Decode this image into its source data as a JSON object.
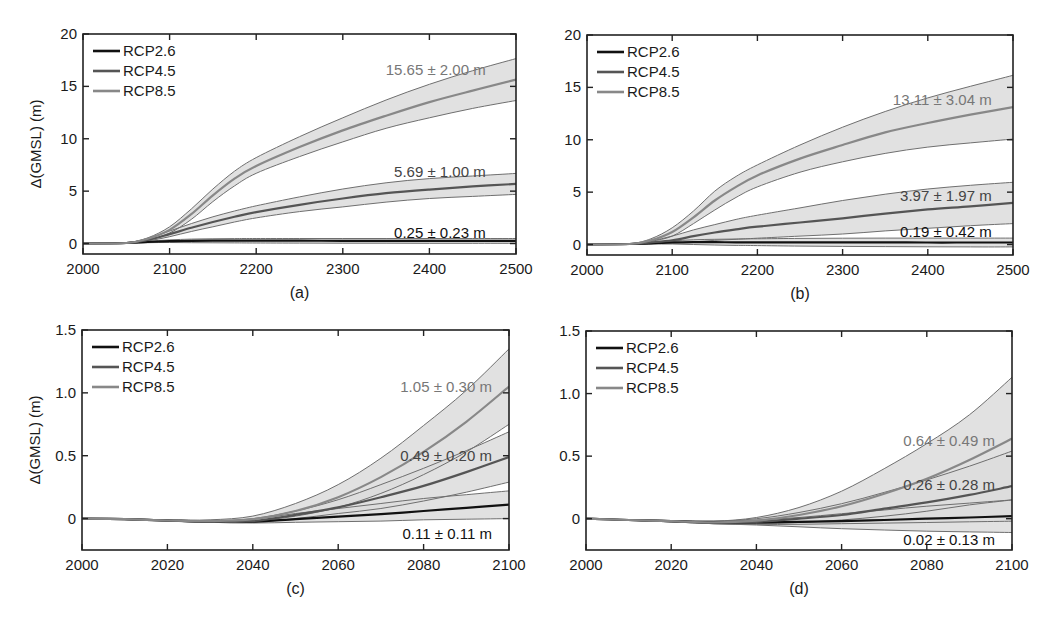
{
  "figure": {
    "ylabel": "Δ(GMSL) (m)",
    "legend": [
      {
        "label": "RCP2.6",
        "color": "#111111"
      },
      {
        "label": "RCP4.5",
        "color": "#555555"
      },
      {
        "label": "RCP8.5",
        "color": "#888888"
      }
    ],
    "band_fill": "#dcdcdc",
    "band_edge": "#6f6f6f"
  },
  "chart_data": [
    {
      "panel": "(a)",
      "type": "area",
      "caption": "(a)",
      "xlim": [
        2000,
        2500
      ],
      "ylim": [
        -1,
        20
      ],
      "xticks": [
        2000,
        2100,
        2200,
        2300,
        2400,
        2500
      ],
      "yticks": [
        0,
        5,
        10,
        15,
        20
      ],
      "ylabel": "Δ(GMSL) (m)",
      "box": {
        "left": 83,
        "right": 516,
        "top": 34,
        "bottom": 254
      },
      "x": [
        2000,
        2050,
        2075,
        2100,
        2125,
        2150,
        2175,
        2200,
        2250,
        2300,
        2350,
        2400,
        2450,
        2500
      ],
      "series": [
        {
          "name": "RCP2.6",
          "color": "#111111",
          "mean": [
            0,
            0.05,
            0.15,
            0.22,
            0.25,
            0.27,
            0.27,
            0.27,
            0.27,
            0.26,
            0.26,
            0.25,
            0.25,
            0.25
          ],
          "upper": [
            0,
            0.08,
            0.22,
            0.35,
            0.42,
            0.45,
            0.47,
            0.48,
            0.48,
            0.48,
            0.48,
            0.48,
            0.48,
            0.48
          ],
          "lower": [
            0,
            0.02,
            0.08,
            0.1,
            0.08,
            0.07,
            0.06,
            0.05,
            0.04,
            0.03,
            0.03,
            0.02,
            0.02,
            0.02
          ]
        },
        {
          "name": "RCP4.5",
          "color": "#555555",
          "mean": [
            0,
            0.05,
            0.35,
            0.9,
            1.5,
            2.05,
            2.55,
            3.0,
            3.7,
            4.3,
            4.8,
            5.15,
            5.45,
            5.69
          ],
          "upper": [
            0,
            0.08,
            0.5,
            1.2,
            1.9,
            2.55,
            3.1,
            3.6,
            4.45,
            5.2,
            5.8,
            6.2,
            6.45,
            6.69
          ],
          "lower": [
            0,
            0.03,
            0.25,
            0.65,
            1.15,
            1.6,
            2.05,
            2.45,
            3.05,
            3.5,
            3.95,
            4.3,
            4.5,
            4.69
          ]
        },
        {
          "name": "RCP8.5",
          "color": "#888888",
          "mean": [
            0,
            0.05,
            0.45,
            1.3,
            2.8,
            4.6,
            6.2,
            7.4,
            9.2,
            10.8,
            12.2,
            13.5,
            14.6,
            15.65
          ],
          "upper": [
            0,
            0.08,
            0.55,
            1.6,
            3.3,
            5.2,
            6.9,
            8.2,
            10.2,
            12.0,
            13.7,
            15.2,
            16.5,
            17.65
          ],
          "lower": [
            0,
            0.03,
            0.35,
            1.0,
            2.3,
            4.0,
            5.5,
            6.7,
            8.3,
            9.7,
            11.0,
            12.0,
            12.9,
            13.65
          ]
        }
      ],
      "annotations": [
        {
          "text": "15.65 ± 2.00 m",
          "x": 2465,
          "y": 16.6,
          "color": "#777777"
        },
        {
          "text": "5.69 ± 1.00 m",
          "x": 2465,
          "y": 6.8,
          "color": "#444444"
        },
        {
          "text": "0.25 ± 0.23 m",
          "x": 2465,
          "y": 1.0,
          "color": "#111111"
        }
      ]
    },
    {
      "panel": "(b)",
      "type": "area",
      "caption": "(b)",
      "xlim": [
        2000,
        2500
      ],
      "ylim": [
        -1,
        20
      ],
      "xticks": [
        2000,
        2100,
        2200,
        2300,
        2400,
        2500
      ],
      "yticks": [
        0,
        5,
        10,
        15,
        20
      ],
      "ylabel": "",
      "box": {
        "left": 587,
        "right": 1013,
        "top": 35,
        "bottom": 255
      },
      "x": [
        2000,
        2050,
        2075,
        2100,
        2125,
        2150,
        2175,
        2200,
        2250,
        2300,
        2350,
        2400,
        2450,
        2500
      ],
      "series": [
        {
          "name": "RCP2.6",
          "color": "#111111",
          "mean": [
            0,
            0.05,
            0.12,
            0.2,
            0.22,
            0.22,
            0.21,
            0.21,
            0.2,
            0.2,
            0.2,
            0.19,
            0.19,
            0.19
          ],
          "upper": [
            0,
            0.08,
            0.2,
            0.35,
            0.45,
            0.5,
            0.53,
            0.55,
            0.58,
            0.6,
            0.61,
            0.61,
            0.61,
            0.61
          ],
          "lower": [
            0,
            0.02,
            0.04,
            0.05,
            0.0,
            -0.05,
            -0.08,
            -0.1,
            -0.15,
            -0.18,
            -0.2,
            -0.22,
            -0.23,
            -0.23
          ]
        },
        {
          "name": "RCP4.5",
          "color": "#555555",
          "mean": [
            0,
            0.05,
            0.2,
            0.4,
            0.8,
            1.15,
            1.45,
            1.7,
            2.1,
            2.5,
            2.95,
            3.35,
            3.65,
            3.97
          ],
          "upper": [
            0,
            0.08,
            0.35,
            0.8,
            1.4,
            1.9,
            2.4,
            2.8,
            3.5,
            4.2,
            4.8,
            5.3,
            5.65,
            5.94
          ],
          "lower": [
            0,
            0.03,
            0.1,
            0.15,
            0.25,
            0.4,
            0.5,
            0.6,
            0.8,
            1.0,
            1.3,
            1.55,
            1.8,
            2.0
          ]
        },
        {
          "name": "RCP8.5",
          "color": "#888888",
          "mean": [
            0,
            0.05,
            0.4,
            1.2,
            2.6,
            4.2,
            5.5,
            6.6,
            8.2,
            9.5,
            10.7,
            11.6,
            12.4,
            13.11
          ],
          "upper": [
            0,
            0.08,
            0.55,
            1.6,
            3.2,
            5.1,
            6.5,
            7.6,
            9.5,
            11.2,
            12.7,
            14.0,
            15.1,
            16.15
          ],
          "lower": [
            0,
            0.03,
            0.3,
            0.8,
            2.0,
            3.3,
            4.5,
            5.5,
            6.9,
            7.9,
            8.7,
            9.3,
            9.7,
            10.07
          ]
        }
      ],
      "annotations": [
        {
          "text": "13.11 ± 3.04 m",
          "x": 2475,
          "y": 13.8,
          "color": "#777777"
        },
        {
          "text": "3.97 ± 1.97 m",
          "x": 2475,
          "y": 4.6,
          "color": "#444444"
        },
        {
          "text": "0.19 ± 0.42 m",
          "x": 2475,
          "y": 1.15,
          "color": "#111111"
        }
      ]
    },
    {
      "panel": "(c)",
      "type": "area",
      "caption": "(c)",
      "xlim": [
        2000,
        2100
      ],
      "ylim": [
        -0.25,
        1.5
      ],
      "xticks": [
        2000,
        2020,
        2040,
        2060,
        2080,
        2100
      ],
      "yticks": [
        0,
        0.5,
        1.0,
        1.5
      ],
      "ytick_labels": [
        "0",
        "0.5",
        "1.0",
        "1.5"
      ],
      "ylabel": "Δ(GMSL) (m)",
      "box": {
        "left": 82,
        "right": 509,
        "top": 330,
        "bottom": 550
      },
      "x": [
        2000,
        2010,
        2020,
        2030,
        2040,
        2050,
        2060,
        2070,
        2080,
        2090,
        2100
      ],
      "series": [
        {
          "name": "RCP2.6",
          "color": "#111111",
          "mean": [
            0,
            -0.005,
            -0.015,
            -0.025,
            -0.025,
            -0.005,
            0.015,
            0.035,
            0.06,
            0.085,
            0.11
          ],
          "upper": [
            0,
            -0.003,
            -0.012,
            -0.02,
            -0.005,
            0.04,
            0.08,
            0.12,
            0.16,
            0.19,
            0.22
          ],
          "lower": [
            0,
            -0.007,
            -0.018,
            -0.03,
            -0.035,
            -0.03,
            -0.025,
            -0.02,
            -0.01,
            -0.005,
            0.0
          ]
        },
        {
          "name": "RCP4.5",
          "color": "#555555",
          "mean": [
            0,
            -0.005,
            -0.015,
            -0.025,
            -0.02,
            0.03,
            0.09,
            0.17,
            0.26,
            0.37,
            0.49
          ],
          "upper": [
            0,
            -0.003,
            -0.01,
            -0.02,
            0.0,
            0.06,
            0.15,
            0.27,
            0.4,
            0.54,
            0.69
          ],
          "lower": [
            0,
            -0.007,
            -0.02,
            -0.03,
            -0.03,
            0.0,
            0.04,
            0.08,
            0.14,
            0.21,
            0.29
          ]
        },
        {
          "name": "RCP8.5",
          "color": "#888888",
          "mean": [
            0,
            -0.005,
            -0.015,
            -0.02,
            -0.005,
            0.06,
            0.17,
            0.33,
            0.53,
            0.77,
            1.05
          ],
          "upper": [
            0,
            -0.003,
            -0.01,
            -0.01,
            0.02,
            0.12,
            0.27,
            0.48,
            0.74,
            1.02,
            1.35
          ],
          "lower": [
            0,
            -0.007,
            -0.02,
            -0.03,
            -0.02,
            0.02,
            0.09,
            0.2,
            0.35,
            0.53,
            0.75
          ]
        }
      ],
      "annotations": [
        {
          "text": "1.05 ± 0.30 m",
          "x": 2096,
          "y": 1.05,
          "color": "#777777"
        },
        {
          "text": "0.49 ± 0.20 m",
          "x": 2096,
          "y": 0.5,
          "color": "#444444"
        },
        {
          "text": "0.11 ± 0.11 m",
          "x": 2096,
          "y": -0.12,
          "color": "#111111"
        }
      ]
    },
    {
      "panel": "(d)",
      "type": "area",
      "caption": "(d)",
      "xlim": [
        2000,
        2100
      ],
      "ylim": [
        -0.25,
        1.5
      ],
      "xticks": [
        2000,
        2020,
        2040,
        2060,
        2080,
        2100
      ],
      "yticks": [
        0,
        0.5,
        1.0,
        1.5
      ],
      "ytick_labels": [
        "0",
        "0.5",
        "1.0",
        "1.5"
      ],
      "ylabel": "",
      "box": {
        "left": 586,
        "right": 1012,
        "top": 331,
        "bottom": 550
      },
      "x": [
        2000,
        2010,
        2020,
        2030,
        2040,
        2050,
        2060,
        2070,
        2080,
        2090,
        2100
      ],
      "series": [
        {
          "name": "RCP2.6",
          "color": "#111111",
          "mean": [
            0,
            -0.01,
            -0.02,
            -0.03,
            -0.03,
            -0.025,
            -0.02,
            -0.01,
            0.0,
            0.01,
            0.02
          ],
          "upper": [
            0,
            -0.008,
            -0.015,
            -0.02,
            -0.01,
            0.01,
            0.04,
            0.07,
            0.1,
            0.125,
            0.15
          ],
          "lower": [
            0,
            -0.012,
            -0.025,
            -0.04,
            -0.05,
            -0.065,
            -0.08,
            -0.09,
            -0.1,
            -0.105,
            -0.11
          ]
        },
        {
          "name": "RCP4.5",
          "color": "#555555",
          "mean": [
            0,
            -0.01,
            -0.02,
            -0.03,
            -0.025,
            0.0,
            0.03,
            0.08,
            0.13,
            0.19,
            0.26
          ],
          "upper": [
            0,
            -0.008,
            -0.015,
            -0.02,
            0.0,
            0.05,
            0.12,
            0.21,
            0.31,
            0.42,
            0.54
          ],
          "lower": [
            0,
            -0.012,
            -0.025,
            -0.04,
            -0.045,
            -0.045,
            -0.04,
            -0.035,
            -0.03,
            -0.025,
            -0.02
          ]
        },
        {
          "name": "RCP8.5",
          "color": "#888888",
          "mean": [
            0,
            -0.01,
            -0.02,
            -0.03,
            -0.015,
            0.03,
            0.1,
            0.2,
            0.32,
            0.47,
            0.64
          ],
          "upper": [
            0,
            -0.008,
            -0.015,
            -0.02,
            0.01,
            0.09,
            0.22,
            0.4,
            0.6,
            0.83,
            1.13
          ],
          "lower": [
            0,
            -0.012,
            -0.025,
            -0.04,
            -0.04,
            -0.03,
            -0.01,
            0.02,
            0.06,
            0.11,
            0.15
          ]
        }
      ],
      "annotations": [
        {
          "text": "0.64 ± 0.49 m",
          "x": 2096,
          "y": 0.62,
          "color": "#777777"
        },
        {
          "text": "0.26 ± 0.28 m",
          "x": 2096,
          "y": 0.27,
          "color": "#444444"
        },
        {
          "text": "0.02 ± 0.13 m",
          "x": 2096,
          "y": -0.17,
          "color": "#111111"
        }
      ]
    }
  ]
}
